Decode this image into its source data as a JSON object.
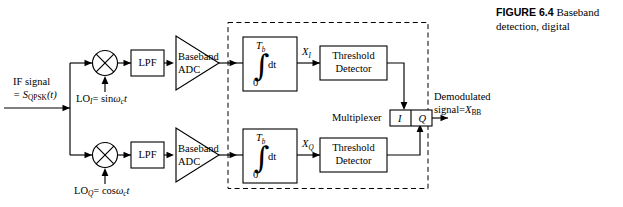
{
  "figure": {
    "number_label": "FIGURE 6.4",
    "caption": "Baseband detection, digital"
  },
  "input": {
    "line1": "IF signal",
    "line2_eq": "= S",
    "line2_sub": "QPSK",
    "line2_arg": "(t)"
  },
  "local_oscillators": {
    "i": {
      "name": "LO",
      "sub": "I",
      "eq": "= sin",
      "omega": "ω",
      "omega_sub": "c",
      "time": "t"
    },
    "q": {
      "name": "LO",
      "sub": "Q",
      "eq": "= cos",
      "omega": "ω",
      "omega_sub": "c",
      "time": "t"
    }
  },
  "blocks": {
    "lpf_i": "LPF",
    "lpf_q": "LPF",
    "adc_i_line1": "Baseband",
    "adc_i_line2": "ADC",
    "adc_q_line1": "Baseband",
    "adc_q_line2": "ADC",
    "integrator_upper_limit": "T",
    "integrator_upper_limit_sub": "b",
    "integrator_sign": "∫",
    "integrator_dt": "dt",
    "integrator_lower_limit": "0",
    "threshold_i_line1": "Threshold",
    "threshold_i_line2": "Detector",
    "threshold_q_line1": "Threshold",
    "threshold_q_line2": "Detector",
    "multiplexer_label": "Multiplexer",
    "mux_cell_i": "I",
    "mux_cell_q": "Q"
  },
  "signals": {
    "x_i": "X",
    "x_i_sub": "I",
    "x_q": "X",
    "x_q_sub": "Q"
  },
  "output": {
    "line1": "Demodulated",
    "line2": "signal",
    "line2_eq": "=",
    "line2_sym": "X",
    "line2_sub": "BB"
  },
  "colors": {
    "ink": "#000000",
    "paper": "#ffffff"
  }
}
